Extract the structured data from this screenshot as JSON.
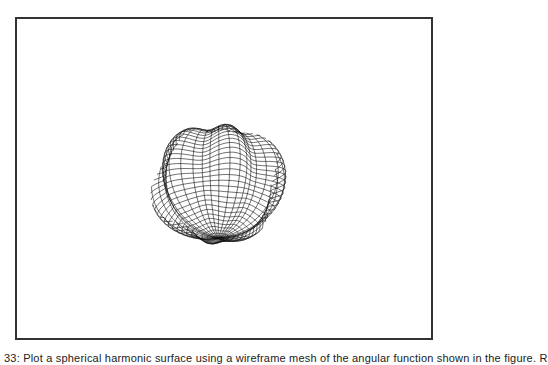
{
  "figure": {
    "caption": "33: Plot a spherical harmonic surface using a wireframe mesh of the angular function shown in the figure. R",
    "frame_color": "#333333",
    "mesh_color": "#111111",
    "surface": {
      "type": "spherical-harmonic-wireframe",
      "center_x": 218,
      "center_y": 183,
      "radius": 62,
      "lat_lines": 36,
      "lon_lines": 40,
      "lobes": 6,
      "bump_amplitude": 0.14
    }
  }
}
